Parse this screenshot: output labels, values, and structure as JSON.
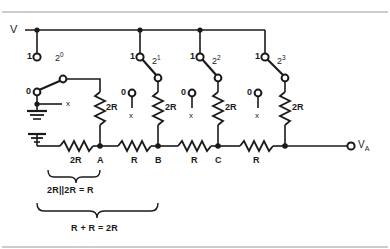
{
  "figure": {
    "supply_label": "V",
    "output_label": "V",
    "output_sub": "A",
    "line_color": "#1a1a1a",
    "background": "#ffffff"
  },
  "border": {
    "top_line": true,
    "bottom_line": true,
    "color": "#999999"
  },
  "branches": [
    {
      "id": "b0",
      "weight_label": "2",
      "weight_exp": "0",
      "one_label": "1",
      "zero_label": "0",
      "x_label": "x",
      "resistor_label": "2R",
      "switch_position": "0"
    },
    {
      "id": "b1",
      "weight_label": "2",
      "weight_exp": "1",
      "one_label": "1",
      "zero_label": "0",
      "x_label": "x",
      "resistor_label": "2R",
      "switch_position": "1"
    },
    {
      "id": "b2",
      "weight_label": "2",
      "weight_exp": "2",
      "one_label": "1",
      "zero_label": "0",
      "x_label": "x",
      "resistor_label": "2R",
      "switch_position": "1"
    },
    {
      "id": "b3",
      "weight_label": "2",
      "weight_exp": "3",
      "one_label": "1",
      "zero_label": "0",
      "x_label": "x",
      "resistor_label": "2R",
      "switch_position": "1"
    }
  ],
  "ladder": {
    "terminator_label": "2R",
    "series_labels": [
      "R",
      "R",
      "R"
    ],
    "nodes": [
      "A",
      "B",
      "C"
    ]
  },
  "annotations": [
    {
      "id": "brace1",
      "text": "2R||2R = R"
    },
    {
      "id": "brace2",
      "text": "R + R = 2R"
    }
  ]
}
